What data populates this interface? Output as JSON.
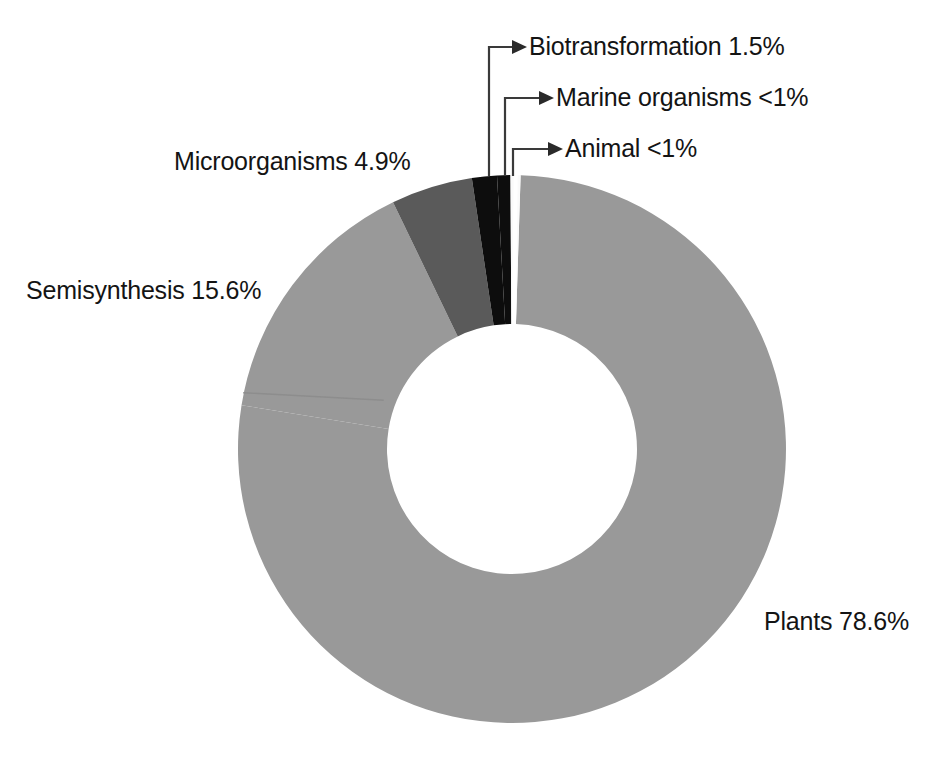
{
  "chart_data": {
    "type": "pie",
    "variant": "donut",
    "title": "",
    "subtitle": "",
    "xlabel": "",
    "ylabel": "",
    "legend_position": "none",
    "grid": false,
    "units": "percent",
    "total_percent": 100,
    "categories": [
      "Plants",
      "Semisynthesis",
      "Microorganisms",
      "Biotransformation",
      "Marine organisms",
      "Animal"
    ],
    "values": [
      78.6,
      15.6,
      4.9,
      1.5,
      0.8,
      0.6
    ],
    "slices": [
      {
        "name": "Plants",
        "value": 78.6,
        "value_text": "78.6%",
        "label": "Plants 78.6%",
        "color": "#999999",
        "start_angle_deg": 1.8,
        "end_angle_deg": 284.76,
        "label_position": "outside-bottom-right",
        "leader_line": false
      },
      {
        "name": "Semisynthesis",
        "value": 15.6,
        "value_text": "15.6%",
        "label": "Semisynthesis 15.6%",
        "color": "#999999",
        "start_angle_deg": 284.76,
        "end_angle_deg": 340.92,
        "label_position": "outside-left",
        "leader_line": false
      },
      {
        "name": "Microorganisms",
        "value": 4.9,
        "value_text": "4.9%",
        "label": "Microorganisms 4.9%",
        "color": "#5a5a5a",
        "start_angle_deg": 340.92,
        "end_angle_deg": 358.56,
        "label_position": "outside-upper-left",
        "leader_line": false
      },
      {
        "name": "Biotransformation",
        "value": 1.5,
        "value_text": "1.5%",
        "label": "Biotransformation 1.5%",
        "color": "#0d0d0d",
        "start_angle_deg": 358.56,
        "end_angle_deg": 363.96,
        "label_position": "outside-top",
        "leader_line": true
      },
      {
        "name": "Marine organisms",
        "value": 0.8,
        "value_text": "<1%",
        "label": "Marine organisms <1%",
        "color": "#0d0d0d",
        "start_angle_deg": 363.96,
        "end_angle_deg": 364.8,
        "label_position": "outside-top",
        "leader_line": true
      },
      {
        "name": "Animal",
        "value": 0.6,
        "value_text": "<1%",
        "label": "Animal <1%",
        "color": "#ffffff",
        "start_angle_deg": 364.8,
        "end_angle_deg": 365.4,
        "label_position": "outside-top",
        "leader_line": true
      }
    ]
  },
  "labels": {
    "biotransformation": "Biotransformation 1.5%",
    "marine_organisms": "Marine organisms <1%",
    "animal": "Animal <1%",
    "microorganisms": "Microorganisms 4.9%",
    "semisynthesis": "Semisynthesis 15.6%",
    "plants": "Plants 78.6%"
  },
  "colors": {
    "background": "#ffffff",
    "plants": "#999999",
    "semisynthesis": "#999999",
    "microorganisms": "#5a5a5a",
    "biotransformation": "#0d0d0d",
    "marine_organisms": "#0d0d0d",
    "animal": "#ffffff",
    "slice_divider": "#ffffff",
    "leader_line": "#3a3a3a",
    "text": "#141414"
  },
  "geometry": {
    "center_x": 512,
    "center_y": 449,
    "outer_radius": 274,
    "inner_radius": 125
  }
}
